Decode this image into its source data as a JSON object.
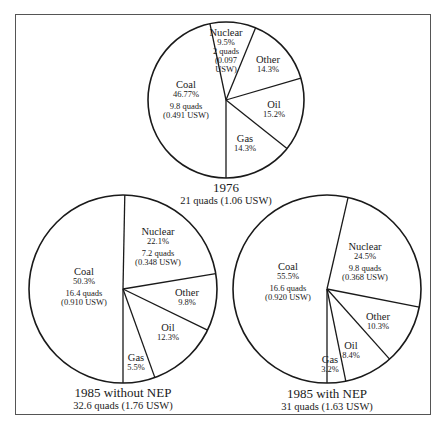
{
  "chart_data": [
    {
      "type": "pie",
      "title": "1976",
      "subtitle": "21 quads (1.06 USW)",
      "center": [
        226,
        100
      ],
      "radius": 78,
      "slices": [
        {
          "label": "Nuclear",
          "percent": 9.5,
          "percent_text": "9.5%",
          "quads": "2 quads",
          "usw": "(0.097 USW)"
        },
        {
          "label": "Other",
          "percent": 14.3,
          "percent_text": "14.3%"
        },
        {
          "label": "Oil",
          "percent": 15.2,
          "percent_text": "15.2%"
        },
        {
          "label": "Gas",
          "percent": 14.3,
          "percent_text": "14.3%"
        },
        {
          "label": "Coal",
          "percent": 46.77,
          "percent_text": "46.77%",
          "quads": "9.8 quads",
          "usw": "(0.491 USW)"
        }
      ]
    },
    {
      "type": "pie",
      "title": "1985 without NEP",
      "subtitle": "32.6 quads (1.76 USW)",
      "center": [
        123,
        289
      ],
      "radius": 94,
      "slices": [
        {
          "label": "Nuclear",
          "percent": 22.1,
          "percent_text": "22.1%",
          "quads": "7.2 quads",
          "usw": "(0.348 USW)"
        },
        {
          "label": "Other",
          "percent": 9.8,
          "percent_text": "9.8%"
        },
        {
          "label": "Oil",
          "percent": 12.3,
          "percent_text": "12.3%"
        },
        {
          "label": "Gas",
          "percent": 5.5,
          "percent_text": "5.5%"
        },
        {
          "label": "Coal",
          "percent": 50.3,
          "percent_text": "50.3%",
          "quads": "16.4 quads",
          "usw": "(0.910 USW)"
        }
      ]
    },
    {
      "type": "pie",
      "title": "1985 with NEP",
      "subtitle": "31 quads (1.63 USW)",
      "center": [
        327,
        289
      ],
      "radius": 94,
      "slices": [
        {
          "label": "Nuclear",
          "percent": 24.5,
          "percent_text": "24.5%",
          "quads": "9.8 quads",
          "usw": "(0.368 USW)"
        },
        {
          "label": "Other",
          "percent": 10.3,
          "percent_text": "10.3%"
        },
        {
          "label": "Oil",
          "percent": 8.4,
          "percent_text": "8.4%"
        },
        {
          "label": "Gas",
          "percent": 3.2,
          "percent_text": "3.2%"
        },
        {
          "label": "Coal",
          "percent": 55.5,
          "percent_text": "55.5%",
          "quads": "16.6 quads",
          "usw": "(0.920 USW)"
        }
      ]
    }
  ],
  "pies": {
    "p1976": {
      "title": "1976",
      "subtitle": "21 quads (1.06 USW)",
      "nuclear": {
        "name": "Nuclear",
        "pct": "9.5%",
        "quads": "2 quads",
        "usw1": "(0.097",
        "usw2": "USW)"
      },
      "other": {
        "name": "Other",
        "pct": "14.3%"
      },
      "oil": {
        "name": "Oil",
        "pct": "15.2%"
      },
      "gas": {
        "name": "Gas",
        "pct": "14.3%"
      },
      "coal": {
        "name": "Coal",
        "pct": "46.77%",
        "quads": "9.8 quads",
        "usw": "(0.491 USW)"
      }
    },
    "p1985a": {
      "title": "1985 without NEP",
      "subtitle": "32.6 quads (1.76 USW)",
      "nuclear": {
        "name": "Nuclear",
        "pct": "22.1%",
        "quads": "7.2 quads",
        "usw": "(0.348 USW)"
      },
      "other": {
        "name": "Other",
        "pct": "9.8%"
      },
      "oil": {
        "name": "Oil",
        "pct": "12.3%"
      },
      "gas": {
        "name": "Gas",
        "pct": "5.5%"
      },
      "coal": {
        "name": "Coal",
        "pct": "50.3%",
        "quads": "16.4 quads",
        "usw": "(0.910 USW)"
      }
    },
    "p1985b": {
      "title": "1985 with NEP",
      "subtitle": "31 quads (1.63 USW)",
      "nuclear": {
        "name": "Nuclear",
        "pct": "24.5%",
        "quads": "9.8 quads",
        "usw": "(0.368 USW)"
      },
      "other": {
        "name": "Other",
        "pct": "10.3%"
      },
      "oil": {
        "name": "Oil",
        "pct": "8.4%"
      },
      "gas": {
        "name": "Gas",
        "pct": "3.2%"
      },
      "coal": {
        "name": "Coal",
        "pct": "55.5%",
        "quads": "16.6 quads",
        "usw": "(0.920 USW)"
      }
    }
  }
}
